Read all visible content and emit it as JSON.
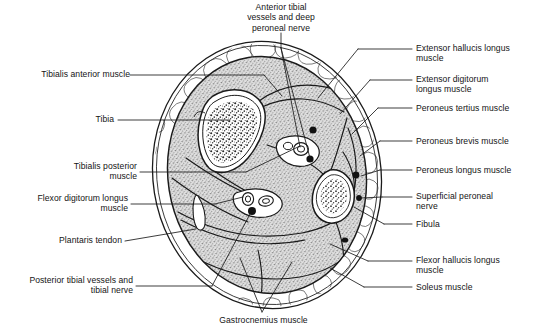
{
  "figure": {
    "background_color": "#ffffff",
    "line_color": "#1a1a1a",
    "muscle_fill": "#d8d8d8",
    "fat_fill": "#ffffff",
    "bone_fill": "#ffffff"
  },
  "labels": {
    "anterior_tibial": "Anterior tibial\nvessels and deep\nperoneal nerve",
    "tibialis_anterior": "Tibialis anterior muscle",
    "tibia": "Tibia",
    "tibialis_posterior": "Tibialis posterior\nmuscle",
    "flexor_digitorum_longus": "Flexor digitorum longus\nmuscle",
    "plantaris_tendon": "Plantaris tendon",
    "posterior_tibial": "Posterior tibial vessels and\ntibial nerve",
    "gastrocnemius": "Gastrocnemius muscle",
    "extensor_hallucis_longus": "Extensor hallucis longus\nmuscle",
    "extensor_digitorum_longus": "Extensor digitorum\nlongus muscle",
    "peroneus_tertius": "Peroneus tertius muscle",
    "peroneus_brevis": "Peroneus brevis muscle",
    "peroneus_longus": "Peroneus longus muscle",
    "superficial_peroneal_nerve": "Superficial peroneal\nnerve",
    "fibula": "Fibula",
    "flexor_hallucis_longus": "Flexor hallucis longus\nmuscle",
    "soleus": "Soleus muscle"
  },
  "structures": {
    "bones": [
      "Tibia",
      "Fibula"
    ],
    "neurovascular_bundles": [
      "Anterior tibial vessels and deep peroneal nerve",
      "Posterior tibial vessels and tibial nerve",
      "Superficial peroneal nerve",
      "Peroneal vessels"
    ],
    "muscle_compartments": [
      "Anterior compartment",
      "Lateral compartment",
      "Superficial posterior compartment",
      "Deep posterior compartment"
    ]
  }
}
